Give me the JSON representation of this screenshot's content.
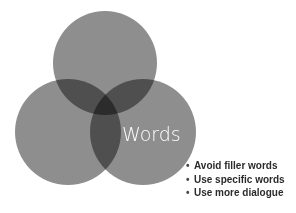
{
  "diagram": {
    "type": "venn",
    "circles": [
      {
        "id": "top",
        "cx": 105,
        "cy": 63,
        "r": 52
      },
      {
        "id": "left",
        "cx": 68,
        "cy": 132,
        "r": 53
      },
      {
        "id": "right",
        "cx": 143,
        "cy": 132,
        "r": 53
      }
    ],
    "fill_color": "#8c8c8c",
    "center_label": "Words",
    "bullets": [
      "Avoid filler words",
      "Use specific words",
      "Use more dialogue"
    ],
    "bullet_glyph": "•"
  }
}
